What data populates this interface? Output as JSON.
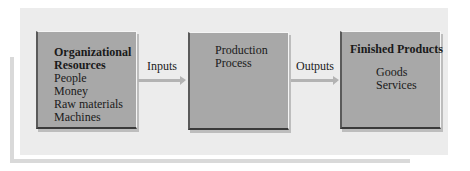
{
  "diagram": {
    "type": "flow",
    "nodes": [
      {
        "id": "resources",
        "title_lines": [
          "Organizational",
          "Resources"
        ],
        "items": [
          "People",
          "Money",
          "Raw materials",
          "Machines"
        ]
      },
      {
        "id": "process",
        "lines": [
          "Production",
          "Process"
        ]
      },
      {
        "id": "products",
        "title": "Finished Products",
        "items": [
          "Goods",
          "Services"
        ]
      }
    ],
    "edges": [
      {
        "from": "resources",
        "to": "process",
        "label": "Inputs"
      },
      {
        "from": "process",
        "to": "products",
        "label": "Outputs"
      }
    ],
    "colors": {
      "panel": "#ececec",
      "box": "#a8a8a8",
      "arrow": "#b3b3b3"
    }
  }
}
